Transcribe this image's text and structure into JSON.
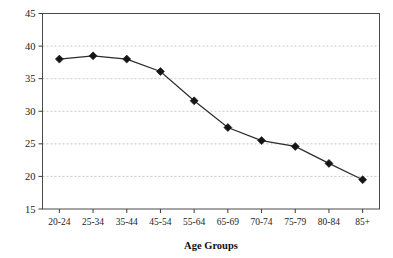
{
  "chart_data": {
    "type": "line",
    "title": "",
    "xlabel": "Age Groups",
    "ylabel": "",
    "categories": [
      "20-24",
      "25-34",
      "35-44",
      "45-54",
      "55-64",
      "65-69",
      "70-74",
      "75-79",
      "80-84",
      "85+"
    ],
    "values": [
      38.0,
      38.5,
      38.0,
      36.1,
      31.6,
      27.5,
      25.5,
      24.6,
      22.0,
      19.5
    ],
    "series": [
      {
        "name": "",
        "values": [
          38.0,
          38.5,
          38.0,
          36.1,
          31.6,
          27.5,
          25.5,
          24.6,
          22.0,
          19.5
        ]
      }
    ],
    "ylim": [
      15,
      45
    ],
    "yticks": [
      15,
      20,
      25,
      30,
      35,
      40,
      45
    ],
    "ytick_labels": [
      "15",
      "20",
      "25",
      "30",
      "35",
      "40",
      "45"
    ],
    "grid": true,
    "grid_axis": "y",
    "grid_style": "dashed",
    "legend": "none",
    "marker": "diamond",
    "marker_color": "#151515",
    "line_color": "#2b2b2b"
  },
  "axes": {
    "x_title": "Age Groups",
    "x_tick_labels": [
      "20-24",
      "25-34",
      "35-44",
      "45-54",
      "55-64",
      "65-69",
      "70-74",
      "75-79",
      "80-84",
      "85+"
    ],
    "y_tick_labels": [
      "45",
      "40",
      "35",
      "30",
      "25",
      "20",
      "15"
    ]
  }
}
